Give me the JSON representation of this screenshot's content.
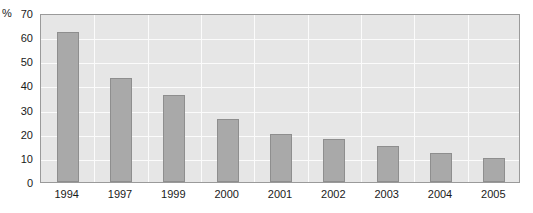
{
  "chart_data": {
    "type": "bar",
    "title": "",
    "xlabel": "",
    "ylabel": "%",
    "categories": [
      "1994",
      "1997",
      "1999",
      "2000",
      "2001",
      "2002",
      "2003",
      "2004",
      "2005"
    ],
    "values": [
      62,
      43,
      36,
      26,
      20,
      18,
      15,
      12,
      10
    ],
    "series": [
      {
        "name": "",
        "values": [
          62,
          43,
          36,
          26,
          20,
          18,
          15,
          12,
          10
        ]
      }
    ],
    "ylim": [
      0,
      70
    ],
    "yticks": [
      0,
      10,
      20,
      30,
      40,
      50,
      60,
      70
    ],
    "ytick_labels": [
      "0",
      "10",
      "20",
      "30",
      "40",
      "50",
      "60",
      "70"
    ],
    "grid": true,
    "grid_orientation": "both",
    "legend": false,
    "legend_position": "none",
    "colors": {
      "bar_fill": "#a9a9a9",
      "bar_edge": "#8e8e8e",
      "plot_background": "#e6e6e6",
      "gridline": "#fbfbfb",
      "axis_border": "#9a9a9a",
      "text": "#1a1a1a",
      "page_background": "#ffffff"
    }
  }
}
